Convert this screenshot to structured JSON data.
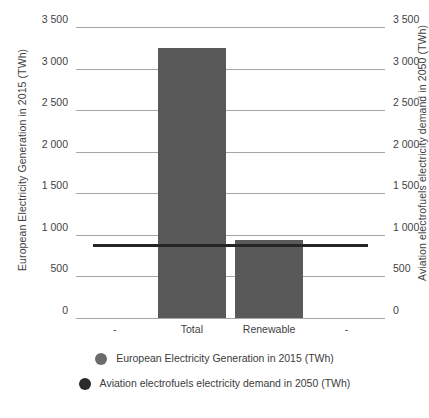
{
  "chart_data": {
    "type": "bar",
    "title": "",
    "subtitle": "",
    "categories": [
      "-",
      "Total",
      "Renewable",
      "-"
    ],
    "series": [
      {
        "name": "European Electricity Generation in 2015 (TWh)",
        "type": "bar",
        "color": "#595959",
        "values": [
          null,
          3250,
          940,
          null
        ]
      },
      {
        "name": "Aviation electrofuels electricity demand in 2050 (TWh)",
        "type": "line",
        "color": "#262626",
        "values": [
          880,
          880,
          880,
          880
        ]
      }
    ],
    "xlabel": "",
    "ylabel": "European Electricity Generation in 2015 (TWh)",
    "y2label": "Aviation electrofuels electricity demand in 2050 (TWh)",
    "ylim": [
      0,
      3500
    ],
    "y2lim": [
      0,
      3500
    ],
    "yticks": [
      0,
      500,
      1000,
      1500,
      2000,
      2500,
      3000,
      3500
    ],
    "ytick_labels": [
      "0",
      "500",
      "1 000",
      "1 500",
      "2 000",
      "2 500",
      "3 000",
      "3 500"
    ],
    "y2tick_labels": [
      "0",
      "500",
      "1 000",
      "1 500",
      "2 000",
      "2 500",
      "3 000",
      "3 500"
    ],
    "grid": true,
    "legend_position": "bottom"
  },
  "axes": {
    "left_title": "European Electricity Generation in 2015 (TWh)",
    "right_title": "Aviation electrofuels electricity demand in 2050 (TWh)",
    "ticks": [
      {
        "value": 3500,
        "label": "3 500"
      },
      {
        "value": 3000,
        "label": "3 000"
      },
      {
        "value": 2500,
        "label": "2 500"
      },
      {
        "value": 2000,
        "label": "2 000"
      },
      {
        "value": 1500,
        "label": "1 500"
      },
      {
        "value": 1000,
        "label": "1 000"
      },
      {
        "value": 500,
        "label": "500"
      },
      {
        "value": 0,
        "label": "0"
      }
    ],
    "categories": [
      {
        "label": "-"
      },
      {
        "label": "Total"
      },
      {
        "label": "Renewable"
      },
      {
        "label": "-"
      }
    ]
  },
  "legend": {
    "items": [
      {
        "label": "European Electricity Generation in 2015 (TWh)",
        "color": "#6b6b6b",
        "marker": "circle-marker"
      },
      {
        "label": "Aviation electrofuels electricity demand in 2050 (TWh)",
        "color": "#2b2b2b",
        "marker": "circle-marker"
      }
    ]
  },
  "colors": {
    "bar": "#595959",
    "line": "#262626",
    "grid": "#a6a6a6",
    "text": "#3f3f3f",
    "background": "#ffffff"
  }
}
